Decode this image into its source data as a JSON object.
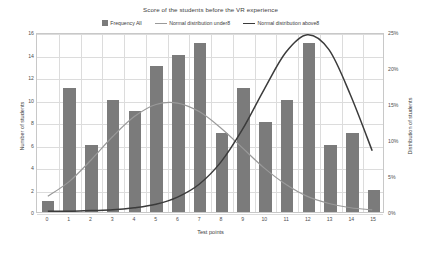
{
  "chart_data": {
    "type": "bar",
    "title": "Score of the students before the VR experience",
    "xlabel": "Test points",
    "ylabel": "Number of students",
    "ylabel_right": "Distribution of students",
    "categories": [
      "0",
      "1",
      "2",
      "3",
      "4",
      "5",
      "6",
      "7",
      "8",
      "9",
      "10",
      "11",
      "12",
      "13",
      "14",
      "15"
    ],
    "values": [
      1,
      11,
      6,
      10,
      9,
      13,
      14,
      15,
      7,
      11,
      8,
      10,
      15,
      6,
      7,
      2
    ],
    "ylim": [
      0,
      16
    ],
    "yticks": [
      "0",
      "2",
      "4",
      "6",
      "8",
      "10",
      "12",
      "14",
      "16"
    ],
    "ylim_right": [
      0,
      25
    ],
    "yticks_right": [
      "0%",
      "5%",
      "10%",
      "15%",
      "20%",
      "25%"
    ],
    "grid": true,
    "legend_position": "top",
    "series": [
      {
        "name": "Frequency All",
        "kind": "bar",
        "color": "#7b7b7b",
        "values": [
          1,
          11,
          6,
          10,
          9,
          13,
          14,
          15,
          7,
          11,
          8,
          10,
          15,
          6,
          7,
          2
        ]
      },
      {
        "name": "Normal distribution under8",
        "kind": "line",
        "color": "#9a9a9a",
        "axis": "right",
        "x": [
          0,
          1,
          2,
          3,
          4,
          5,
          6,
          7,
          8,
          9,
          10,
          11,
          12,
          13,
          14,
          15
        ],
        "values": [
          2.2,
          4.3,
          7.3,
          10.6,
          13.4,
          15.1,
          15.3,
          14.1,
          11.8,
          9.0,
          6.2,
          3.9,
          2.2,
          1.2,
          0.6,
          0.3
        ]
      },
      {
        "name": "Normal distribution above8",
        "kind": "line",
        "color": "#3b3b3b",
        "axis": "right",
        "x": [
          0,
          1,
          2,
          3,
          4,
          5,
          6,
          7,
          8,
          9,
          10,
          11,
          12,
          13,
          14,
          15
        ],
        "values": [
          0.1,
          0.1,
          0.2,
          0.3,
          0.6,
          1.1,
          2.1,
          3.9,
          7.0,
          11.6,
          17.2,
          22.4,
          24.9,
          22.8,
          16.4,
          8.6
        ]
      }
    ]
  }
}
